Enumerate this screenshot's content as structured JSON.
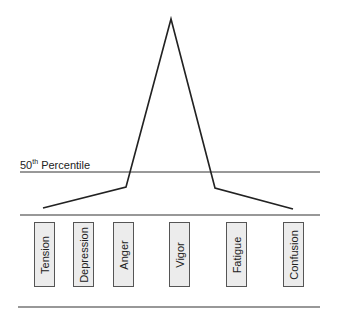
{
  "reference_line": {
    "label_prefix": "50",
    "label_sup": "th",
    "label_suffix": " Percentile"
  },
  "scales": [
    {
      "label": "Tension",
      "relative_level": "below"
    },
    {
      "label": "Depression",
      "relative_level": "below"
    },
    {
      "label": "Anger",
      "relative_level": "below"
    },
    {
      "label": "Vigor",
      "relative_level": "far-above"
    },
    {
      "label": "Fatigue",
      "relative_level": "below"
    },
    {
      "label": "Confusion",
      "relative_level": "below"
    }
  ],
  "colors": {
    "line": "#222222",
    "box_fill": "#ececec",
    "box_border": "#555555"
  }
}
